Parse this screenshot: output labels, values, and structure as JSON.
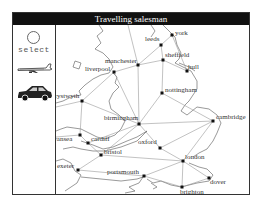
{
  "window": {
    "title": "Travelling salesman"
  },
  "sidebar": {
    "tools": [
      {
        "id": "select",
        "label": "select",
        "icon": "circle-select-icon"
      },
      {
        "id": "plane",
        "label": "",
        "icon": "airplane-icon"
      },
      {
        "id": "car",
        "label": "",
        "icon": "car-icon"
      }
    ]
  },
  "map": {
    "cities": [
      {
        "name": "york",
        "x": 171,
        "y": 34
      },
      {
        "name": "leeds",
        "x": 160,
        "y": 44
      },
      {
        "name": "sheffield",
        "x": 162,
        "y": 59
      },
      {
        "name": "hull",
        "x": 186,
        "y": 70
      },
      {
        "name": "manchester",
        "x": 137,
        "y": 64
      },
      {
        "name": "liverpool",
        "x": 113,
        "y": 71
      },
      {
        "name": "nottingham",
        "x": 161,
        "y": 92
      },
      {
        "name": "aberystwyth",
        "x": 81,
        "y": 100
      },
      {
        "name": "birmingham",
        "x": 138,
        "y": 123
      },
      {
        "name": "cambridge",
        "x": 212,
        "y": 120
      },
      {
        "name": "swansea",
        "x": 79,
        "y": 134
      },
      {
        "name": "cardiff",
        "x": 87,
        "y": 142
      },
      {
        "name": "oxford",
        "x": 159,
        "y": 147
      },
      {
        "name": "bristol",
        "x": 100,
        "y": 154
      },
      {
        "name": "london",
        "x": 182,
        "y": 160
      },
      {
        "name": "exeter",
        "x": 77,
        "y": 169
      },
      {
        "name": "portsmouth",
        "x": 143,
        "y": 175
      },
      {
        "name": "dover",
        "x": 208,
        "y": 177
      },
      {
        "name": "brighton",
        "x": 181,
        "y": 186
      }
    ]
  }
}
